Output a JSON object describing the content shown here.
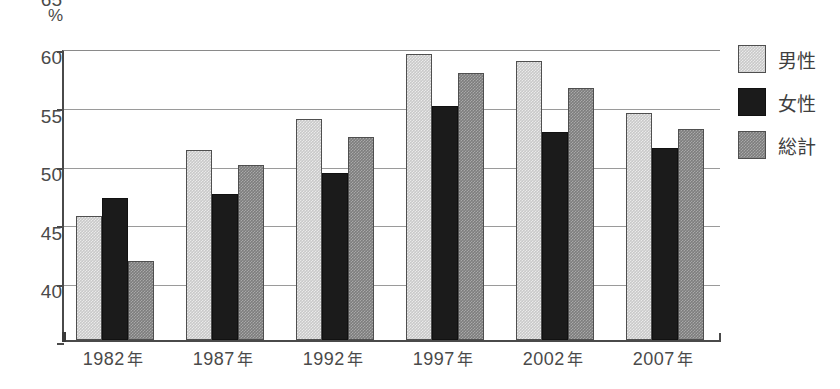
{
  "chart_data": {
    "type": "bar",
    "title": "",
    "xlabel": "",
    "ylabel": "%",
    "unit_label": "%",
    "ylim": [
      40,
      65
    ],
    "yticks": [
      40,
      45,
      50,
      55,
      60,
      65
    ],
    "ytick_labels": [
      "40",
      "45",
      "50",
      "55",
      "60",
      "65"
    ],
    "grid": true,
    "grid_axis": "y",
    "legend_position": "right",
    "categories": [
      "1982年",
      "1987年",
      "1992年",
      "1997年",
      "2002年",
      "2007年"
    ],
    "series": [
      {
        "name": "男性",
        "color": "#c9c9c9",
        "values": [
          50.6,
          56.3,
          58.9,
          64.5,
          63.9,
          59.4
        ]
      },
      {
        "name": "女性",
        "color": "#1b1b1b",
        "values": [
          52.2,
          52.5,
          54.3,
          60.0,
          57.8,
          56.4
        ]
      },
      {
        "name": "総計",
        "color": "#7d7d7d",
        "values": [
          46.8,
          55.0,
          57.4,
          62.9,
          61.6,
          58.1
        ]
      }
    ]
  },
  "legend": {
    "items": [
      {
        "label": "男性",
        "swatch": "male"
      },
      {
        "label": "女性",
        "swatch": "female"
      },
      {
        "label": "総計",
        "swatch": "total"
      }
    ]
  }
}
